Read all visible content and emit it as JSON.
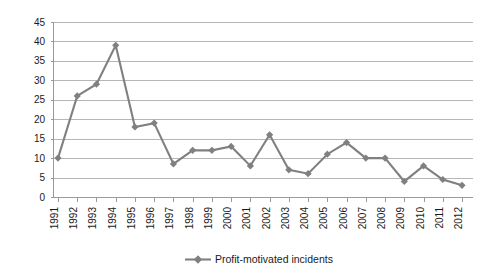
{
  "chart_data": {
    "type": "line",
    "title": "",
    "subtitle": "",
    "xlabel": "",
    "ylabel": "",
    "categories": [
      "1991",
      "1992",
      "1993",
      "1994",
      "1995",
      "1996",
      "1997",
      "1998",
      "1999",
      "2000",
      "2001",
      "2002",
      "2003",
      "2004",
      "2005",
      "2006",
      "2007",
      "2008",
      "2009",
      "2010",
      "2011",
      "2012"
    ],
    "series": [
      {
        "name": "Profit-motivated incidents",
        "color": "#808080",
        "marker": "diamond",
        "values": [
          10,
          26,
          29,
          39,
          18,
          19,
          8.5,
          12,
          12,
          13,
          8,
          16,
          7,
          6,
          11,
          14,
          10,
          10,
          4,
          8,
          4.5,
          3
        ]
      }
    ],
    "ylim": [
      0,
      45
    ],
    "yticks": [
      0,
      5,
      10,
      15,
      20,
      25,
      30,
      35,
      40,
      45
    ],
    "ytick_labels": [
      "0",
      "5",
      "10",
      "15",
      "20",
      "25",
      "30",
      "35",
      "40",
      "45"
    ],
    "grid": true,
    "grid_axis": "y",
    "legend_position": "bottom",
    "legend_entries": [
      {
        "label": "Profit-motivated incidents",
        "color": "#808080"
      }
    ]
  },
  "colors": {
    "series": "#808080",
    "grid": "#b6b6b6",
    "axis": "#9a9a9a",
    "text": "#1a1a1a",
    "background": "#ffffff"
  }
}
